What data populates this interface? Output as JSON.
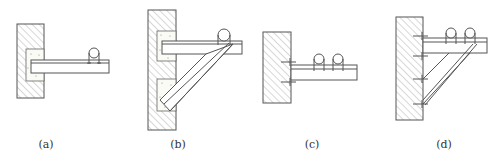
{
  "figure": {
    "width": 504,
    "height": 163,
    "line_color": "#555555",
    "hatch_color": "#9a9a9a"
  },
  "panels": [
    {
      "id": "a",
      "label": "(a)",
      "label_pos": [
        46,
        145
      ],
      "description": "Cantilever bracket embedded in wall with grout pocket, single pipe with U-bolt"
    },
    {
      "id": "b",
      "label": "(b)",
      "label_pos": [
        178,
        145
      ],
      "description": "Bracket with diagonal brace, both embedded in grout pockets, single pipe"
    },
    {
      "id": "c",
      "label": "(c)",
      "label_pos": [
        312,
        145
      ],
      "description": "Bracket bolted to wall with expansion anchors, two pipes"
    },
    {
      "id": "d",
      "label": "(d)",
      "label_pos": [
        444,
        145
      ],
      "description": "Bracket with double diagonal braces, bolted to wall with four anchors, two pipes"
    }
  ]
}
